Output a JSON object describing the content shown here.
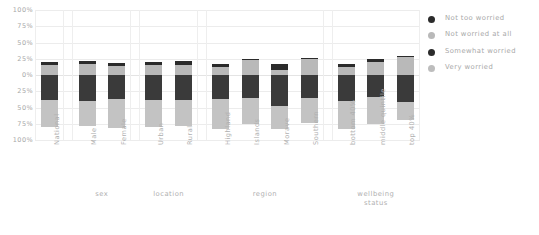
{
  "chart_data": {
    "type": "bar",
    "subtype": "diverging-stacked-bar",
    "title": "",
    "xlabel": "",
    "ylabel": "",
    "grid": true,
    "legend_position": "right",
    "y_ticks": [
      "100%",
      "75%",
      "50%",
      "25%",
      "0%",
      "25%",
      "50%",
      "75%",
      "100%"
    ],
    "y_tick_values": [
      100,
      75,
      50,
      25,
      0,
      25,
      50,
      75,
      100
    ],
    "ylim": [
      -100,
      100
    ],
    "categories": [
      "National",
      "Male",
      "Female",
      "Urban",
      "Rural",
      "Highland",
      "Islands",
      "Morave",
      "Southern",
      "bottom 40%",
      "middle quintile",
      "top 40%"
    ],
    "groups": [
      {
        "label": "",
        "categories": [
          "National"
        ]
      },
      {
        "label": "sex",
        "categories": [
          "Male",
          "Female"
        ]
      },
      {
        "label": "location",
        "categories": [
          "Urban",
          "Rural"
        ]
      },
      {
        "label": "region",
        "categories": [
          "Highland",
          "Islands",
          "Morave",
          "Southern"
        ]
      },
      {
        "label": "wellbeing status",
        "label_line1": "wellbeing",
        "label_line2": "status",
        "categories": [
          "bottom 40%",
          "middle quintile",
          "top 40%"
        ]
      }
    ],
    "series": [
      {
        "name": "Not too worried",
        "color": "#2b2b2b",
        "direction": "up",
        "values": [
          5,
          5,
          4,
          5,
          5,
          4,
          1,
          9,
          2,
          5,
          4,
          3
        ]
      },
      {
        "name": "Not worried at all",
        "color": "#b9b9b9",
        "direction": "up",
        "values": [
          15,
          17,
          14,
          15,
          16,
          13,
          24,
          8,
          24,
          12,
          20,
          27
        ]
      },
      {
        "name": "Somewhat worried",
        "color": "#3a3a3a",
        "direction": "down",
        "values": [
          38,
          40,
          37,
          39,
          38,
          37,
          36,
          48,
          35,
          40,
          34,
          42
        ]
      },
      {
        "name": "Very worried",
        "color": "#c3c3c3",
        "direction": "down",
        "values": [
          42,
          38,
          45,
          41,
          41,
          46,
          39,
          35,
          39,
          43,
          42,
          28
        ]
      }
    ]
  },
  "legend": {
    "items": [
      {
        "label": "Not too worried",
        "color": "#2b2b2b"
      },
      {
        "label": "Not worried at all",
        "color": "#b9b9b9"
      },
      {
        "label": "Somewhat worried",
        "color": "#2b2b2b"
      },
      {
        "label": "Very worried",
        "color": "#bdbdbd"
      }
    ]
  }
}
